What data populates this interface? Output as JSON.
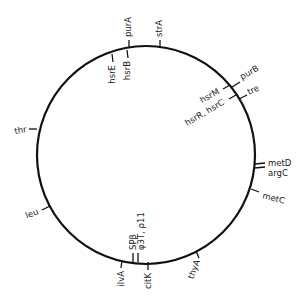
{
  "diagram": {
    "type": "circular-genetic-map",
    "circle": {
      "cx": 146,
      "cy": 155,
      "r": 109,
      "stroke": "#111111"
    },
    "markers": [
      {
        "id": "purA",
        "label": "purA",
        "side": "outer",
        "x1": 129,
        "y1": 48,
        "x2": 129,
        "y2": 40,
        "tx": 131,
        "ty": 37,
        "rot": -90,
        "anchor": "start"
      },
      {
        "id": "strA",
        "label": "strA",
        "side": "outer",
        "x1": 160,
        "y1": 48,
        "x2": 160,
        "y2": 40,
        "tx": 162,
        "ty": 37,
        "rot": -90,
        "anchor": "start"
      },
      {
        "id": "hsrE",
        "label": "hsrE",
        "side": "inner",
        "x1": 112,
        "y1": 54,
        "x2": 113,
        "y2": 62,
        "tx": 115,
        "ty": 65,
        "rot": -90,
        "anchor": "end"
      },
      {
        "id": "hsrB",
        "label": "hsrB",
        "side": "inner",
        "x1": 127,
        "y1": 50,
        "x2": 128,
        "y2": 58,
        "tx": 130,
        "ty": 61,
        "rot": -90,
        "anchor": "end"
      },
      {
        "id": "purB",
        "label": "purB",
        "side": "outer",
        "x1": 232,
        "y1": 87,
        "x2": 240,
        "y2": 82,
        "tx": 242,
        "ty": 80,
        "rot": -30,
        "anchor": "start"
      },
      {
        "id": "tre",
        "label": "tre",
        "side": "outer",
        "x1": 239,
        "y1": 99,
        "x2": 247,
        "y2": 95,
        "tx": 249,
        "ty": 95,
        "rot": -25,
        "anchor": "start"
      },
      {
        "id": "hsrM",
        "label": "hsrM",
        "side": "inner",
        "x1": 230,
        "y1": 85,
        "x2": 223,
        "y2": 89,
        "tx": 220,
        "ty": 93,
        "rot": -30,
        "anchor": "end"
      },
      {
        "id": "hsrRC",
        "label": "hsrR, hsrC",
        "side": "inner",
        "x1": 236,
        "y1": 95,
        "x2": 229,
        "y2": 99,
        "tx": 225,
        "ty": 104,
        "rot": -30,
        "anchor": "end"
      },
      {
        "id": "metD",
        "label": "metD",
        "side": "outer",
        "x1": 255,
        "y1": 164,
        "x2": 265,
        "y2": 163,
        "tx": 268,
        "ty": 166,
        "rot": 0,
        "anchor": "start"
      },
      {
        "id": "argC",
        "label": "argC",
        "side": "outer",
        "x1": 255,
        "y1": 168,
        "x2": 265,
        "y2": 167,
        "tx": 268,
        "ty": 176,
        "rot": 0,
        "anchor": "start"
      },
      {
        "id": "metC",
        "label": "metC",
        "side": "outer",
        "x1": 251,
        "y1": 189,
        "x2": 259,
        "y2": 192,
        "tx": 262,
        "ty": 198,
        "rot": 15,
        "anchor": "start"
      },
      {
        "id": "thyA",
        "label": "thyA",
        "side": "outer",
        "x1": 196,
        "y1": 251,
        "x2": 199,
        "y2": 258,
        "tx": 200,
        "ty": 261,
        "rot": -70,
        "anchor": "end"
      },
      {
        "id": "citK",
        "label": "citK",
        "side": "outer",
        "x1": 148,
        "y1": 262,
        "x2": 148,
        "y2": 270,
        "tx": 151,
        "ty": 273,
        "rot": -90,
        "anchor": "end"
      },
      {
        "id": "ilvA",
        "label": "ilvA",
        "side": "outer",
        "x1": 122,
        "y1": 260,
        "x2": 121,
        "y2": 268,
        "tx": 124,
        "ty": 271,
        "rot": -90,
        "anchor": "end"
      },
      {
        "id": "SPbeta",
        "label": "SPβ",
        "side": "inner",
        "x1": 133,
        "y1": 262,
        "x2": 133,
        "y2": 253,
        "tx": 136,
        "ty": 250,
        "rot": -90,
        "anchor": "start"
      },
      {
        "id": "phi3T",
        "label": "φ3T, ρ11",
        "side": "inner",
        "x1": 138,
        "y1": 262,
        "x2": 138,
        "y2": 253,
        "tx": 144,
        "ty": 250,
        "rot": -90,
        "anchor": "start"
      },
      {
        "id": "leu",
        "label": "leu",
        "side": "outer",
        "x1": 50,
        "y1": 206,
        "x2": 42,
        "y2": 210,
        "tx": 39,
        "ty": 214,
        "rot": -20,
        "anchor": "end"
      },
      {
        "id": "thr",
        "label": "thr",
        "side": "outer",
        "x1": 37,
        "y1": 129,
        "x2": 29,
        "y2": 129,
        "tx": 27,
        "ty": 132,
        "rot": -10,
        "anchor": "end"
      }
    ]
  }
}
